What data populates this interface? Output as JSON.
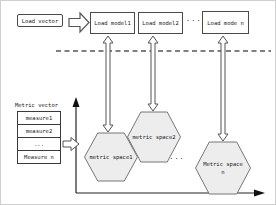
{
  "diagram": {
    "title_implicit": "load-model metric-space mapping diagram",
    "load_vector_label": "Load vector",
    "load_models": [
      "Load model1",
      "Load model2",
      "Load mode n"
    ],
    "ellipsis_top": "...",
    "ellipsis_bottom": "...",
    "metric_vector": {
      "title": "Metric vector",
      "rows": [
        "measure1",
        "measure2",
        "...",
        "Measure n"
      ]
    },
    "metric_spaces": [
      "metric space1",
      "metric space2",
      "Metric space n"
    ],
    "colors": {
      "hexagon_fill": "#ededed",
      "hexagon_border": "#777777",
      "line": "#444444",
      "axis": "#222222",
      "background": "#ffffff"
    }
  }
}
